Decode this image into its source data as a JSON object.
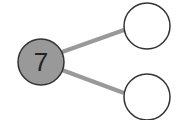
{
  "diagram": {
    "type": "number-bond",
    "whole": {
      "value": "7",
      "fill": "#999999",
      "stroke": "#333333"
    },
    "parts": [
      {
        "value": "",
        "fill": "#ffffff",
        "stroke": "#333333"
      },
      {
        "value": "",
        "fill": "#ffffff",
        "stroke": "#333333"
      }
    ],
    "connector_color": "#999999"
  }
}
